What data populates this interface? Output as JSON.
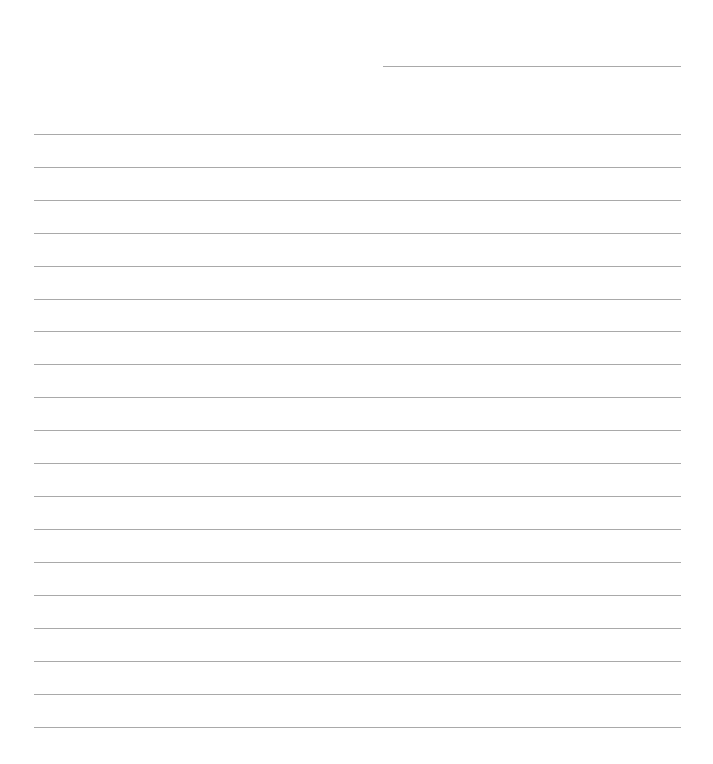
{
  "page": {
    "type": "lined-paper",
    "background": "#ffffff",
    "line_color": "#a9a9a9",
    "header_line": {
      "label": ""
    },
    "rules": [
      {
        "y": 134,
        "text": ""
      },
      {
        "y": 167,
        "text": ""
      },
      {
        "y": 200,
        "text": ""
      },
      {
        "y": 233,
        "text": ""
      },
      {
        "y": 266,
        "text": ""
      },
      {
        "y": 299,
        "text": ""
      },
      {
        "y": 331,
        "text": ""
      },
      {
        "y": 364,
        "text": ""
      },
      {
        "y": 397,
        "text": ""
      },
      {
        "y": 430,
        "text": ""
      },
      {
        "y": 463,
        "text": ""
      },
      {
        "y": 496,
        "text": ""
      },
      {
        "y": 529,
        "text": ""
      },
      {
        "y": 562,
        "text": ""
      },
      {
        "y": 595,
        "text": ""
      },
      {
        "y": 628,
        "text": ""
      },
      {
        "y": 661,
        "text": ""
      },
      {
        "y": 694,
        "text": ""
      },
      {
        "y": 727,
        "text": ""
      }
    ]
  }
}
